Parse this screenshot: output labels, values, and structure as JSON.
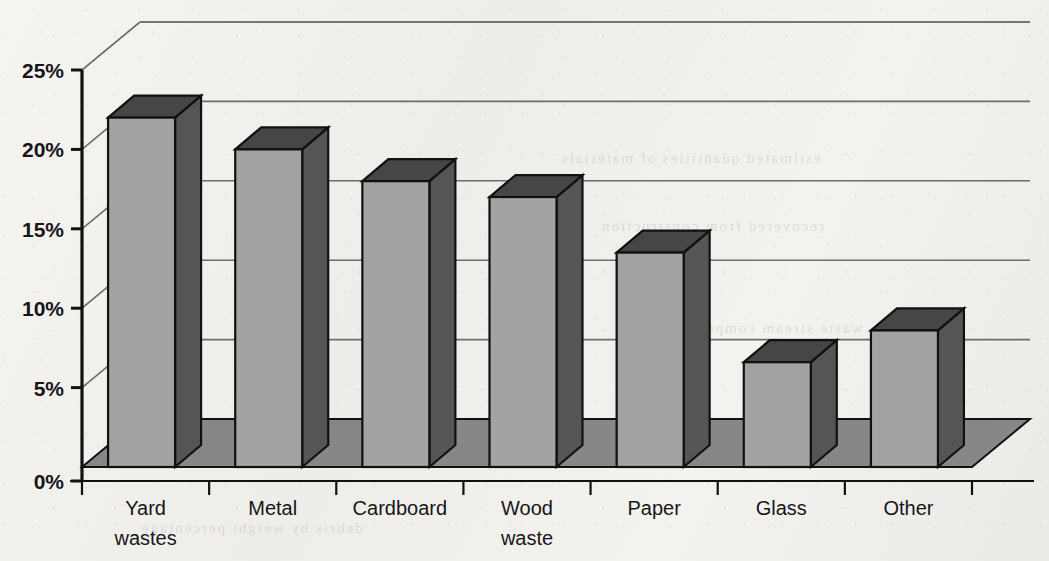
{
  "chart_data": {
    "type": "bar",
    "title": "",
    "subtitle": "",
    "xlabel": "",
    "ylabel": "",
    "categories": [
      "Yard wastes",
      "Metal",
      "Cardboard",
      "Wood waste",
      "Paper",
      "Glass",
      "Other"
    ],
    "category_lines": [
      [
        "Yard",
        "wastes"
      ],
      [
        "Metal"
      ],
      [
        "Cardboard"
      ],
      [
        "Wood",
        "waste"
      ],
      [
        "Paper"
      ],
      [
        "Glass"
      ],
      [
        "Other"
      ]
    ],
    "values": [
      22.0,
      20.0,
      18.0,
      17.0,
      13.5,
      6.6,
      8.6
    ],
    "value_labels": [
      "",
      "",
      "",
      "",
      "",
      "",
      ""
    ],
    "ylim": [
      0,
      25
    ],
    "ytick_values": [
      0,
      5,
      10,
      15,
      20,
      25
    ],
    "ytick_labels": [
      "0%",
      "5%",
      "10%",
      "15%",
      "20%",
      "25%"
    ],
    "grid": true,
    "grid_axis": "y",
    "legend": false,
    "legend_position": "none",
    "style": "3d-bar",
    "colors": {
      "bar_front": "#a8a8a8",
      "bar_side": "#585858",
      "bar_top": "#4a4a4a",
      "floor": "#8b8b8b",
      "outline": "#111111",
      "gridline": "#6d6d6d",
      "axis": "#111111",
      "background": "#f3f1ee",
      "text": "#16161a"
    }
  },
  "ghost_text": {
    "lines": [
      "estimated quantities of materials",
      "recovered from construction",
      "debris by weight percentage",
      "waste stream composition data"
    ]
  }
}
